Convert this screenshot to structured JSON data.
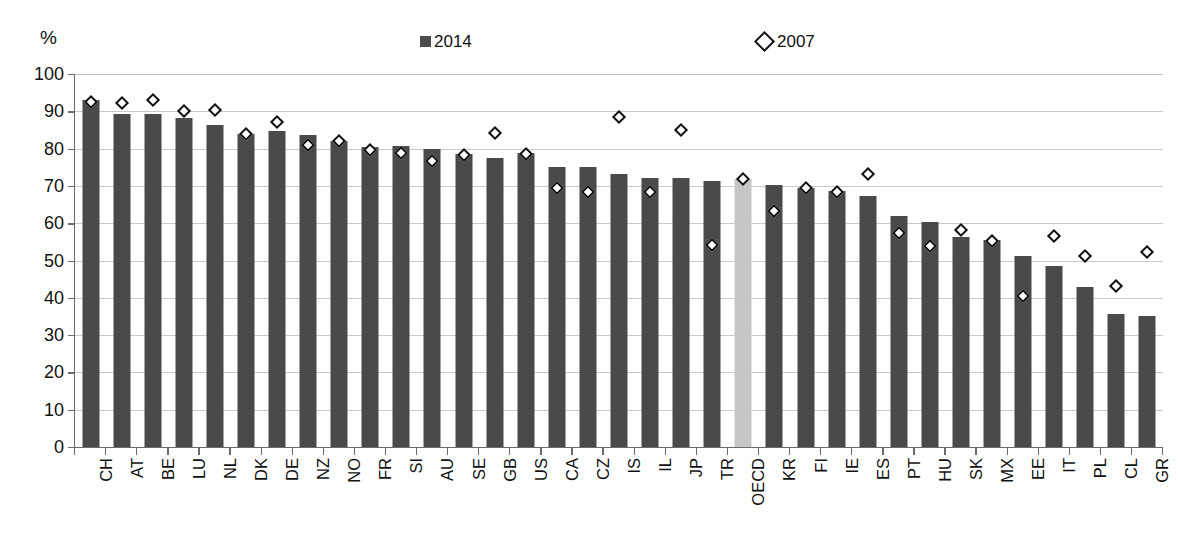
{
  "axis": {
    "y_unit_label": "%",
    "y_ticks": [
      100,
      90,
      80,
      70,
      60,
      50,
      40,
      30,
      20,
      10,
      0
    ],
    "ylim": [
      0,
      100
    ]
  },
  "legend": {
    "items": [
      {
        "label": "2014",
        "marker": "square",
        "color": "#4d4d4d"
      },
      {
        "label": "2007",
        "marker": "diamond",
        "color": "#111111"
      }
    ]
  },
  "colors": {
    "bar": "#4a4a4a",
    "bar_highlight": "#c6c6c6",
    "grid": "#c9c9c9",
    "axis": "#6b6b6b",
    "marker_fill": "#ffffff",
    "marker_stroke": "#111111"
  },
  "chart_data": {
    "type": "bar",
    "title": "",
    "xlabel": "",
    "ylabel": "%",
    "ylim": [
      0,
      100
    ],
    "grid": true,
    "legend_position": "top",
    "highlight_category": "OECD",
    "categories": [
      "CH",
      "AT",
      "BE",
      "LU",
      "NL",
      "DK",
      "DE",
      "NZ",
      "NO",
      "FR",
      "SI",
      "AU",
      "SE",
      "GB",
      "US",
      "CA",
      "CZ",
      "IS",
      "IL",
      "JP",
      "TR",
      "OECD",
      "KR",
      "FI",
      "IE",
      "ES",
      "PT",
      "HU",
      "SK",
      "MX",
      "EE",
      "IT",
      "PL",
      "CL",
      "GR"
    ],
    "series": [
      {
        "name": "2014",
        "type": "bar",
        "values": [
          93.0,
          89.2,
          89.2,
          88.2,
          86.3,
          83.8,
          84.8,
          83.6,
          82.0,
          80.3,
          80.6,
          79.8,
          78.6,
          77.4,
          78.7,
          75.1,
          75.1,
          73.1,
          72.2,
          72.2,
          71.2,
          71.8,
          70.2,
          69.5,
          68.7,
          67.3,
          62.0,
          60.3,
          56.3,
          55.4,
          51.2,
          48.4,
          43.0,
          35.6,
          35.2
        ]
      },
      {
        "name": "2007",
        "type": "scatter",
        "marker": "diamond",
        "values": [
          92.4,
          92.1,
          93.0,
          90.2,
          90.3,
          83.9,
          87.2,
          81.1,
          82.0,
          79.5,
          78.7,
          76.6,
          78.3,
          84.1,
          78.6,
          69.4,
          68.5,
          88.4,
          68.5,
          85.0,
          54.2,
          71.9,
          63.2,
          69.4,
          68.3,
          73.1,
          57.5,
          54.0,
          58.2,
          55.3,
          40.4,
          56.5,
          51.2,
          43.2,
          52.3
        ]
      }
    ]
  }
}
